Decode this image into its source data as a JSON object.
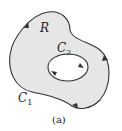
{
  "figure": {
    "caption": "(a)",
    "region_label": "R",
    "outer_curve": {
      "label": "C",
      "subscript": "1",
      "orientation": "counterclockwise"
    },
    "inner_curve": {
      "label": "C",
      "subscript": "2",
      "orientation": "clockwise"
    },
    "colors": {
      "fill": "#e6e6e6",
      "stroke": "#333333",
      "hole": "#ffffff"
    }
  }
}
